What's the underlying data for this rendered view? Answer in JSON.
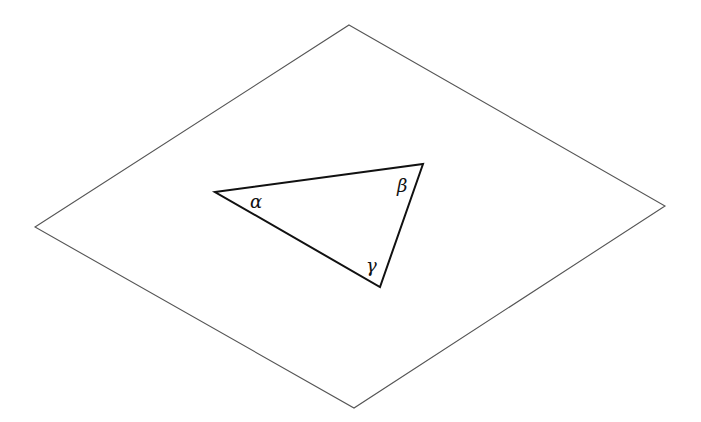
{
  "diagram": {
    "plane": {
      "stroke": "#555555",
      "points": [
        [
          349,
          25
        ],
        [
          665,
          206
        ],
        [
          354,
          408
        ],
        [
          35,
          227
        ]
      ]
    },
    "triangle": {
      "stroke": "#111111",
      "vertices": [
        [
          215,
          192
        ],
        [
          423,
          164
        ],
        [
          380,
          287
        ]
      ],
      "angles": [
        {
          "label": "α",
          "x": 250,
          "y": 208
        },
        {
          "label": "β",
          "x": 397,
          "y": 192
        },
        {
          "label": "γ",
          "x": 366,
          "y": 272
        }
      ]
    }
  }
}
